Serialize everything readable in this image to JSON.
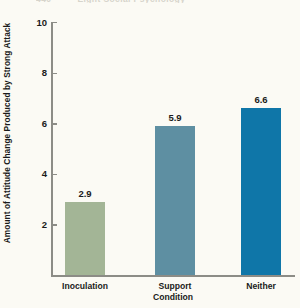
{
  "page_header": {
    "visible_fragment": "Eight Social Psychology",
    "page_number": "440"
  },
  "chart_data": {
    "type": "bar",
    "title": "",
    "categories": [
      "Inoculation",
      "Support",
      "Neither"
    ],
    "values": [
      2.9,
      5.9,
      6.6
    ],
    "value_labels": [
      "2.9",
      "5.9",
      "6.6"
    ],
    "xlabel": "Condition",
    "ylabel": "Amount of Attitude Change Produced by Strong Attack",
    "ylim": [
      0,
      10
    ],
    "yticks": [
      2,
      4,
      6,
      8,
      10
    ],
    "ytick_labels": [
      "2",
      "4",
      "6",
      "8",
      "10"
    ],
    "grid": false,
    "legend": false,
    "bar_colors": [
      "#a3b596",
      "#5e8fa2",
      "#0f76a8"
    ],
    "background_color": "#fbfaf4",
    "axis_color": "#8c8c86"
  }
}
